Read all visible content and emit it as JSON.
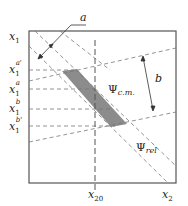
{
  "diagram": {
    "axes": {
      "y_label": "x",
      "y_label_sub": "1",
      "x_label": "x",
      "x_label_sub": "2",
      "x_tick_label": "x",
      "x_tick_sub": "20"
    },
    "y_ticks": [
      {
        "base": "x",
        "sub": "1",
        "sup": "a'"
      },
      {
        "base": "x",
        "sub": "1",
        "sup": "a"
      },
      {
        "base": "x",
        "sub": "1",
        "sup": "b"
      },
      {
        "base": "x",
        "sub": "1",
        "sup": "b'"
      }
    ],
    "annotations": {
      "a": "a",
      "b": "b",
      "psi_cm": "Ψ",
      "psi_cm_sub": "c.m.",
      "psi_rel": "Ψ",
      "psi_rel_sub": "rel"
    },
    "colors": {
      "frame": "#555555",
      "dash": "#777777",
      "shade": "#8c8c8c"
    }
  }
}
